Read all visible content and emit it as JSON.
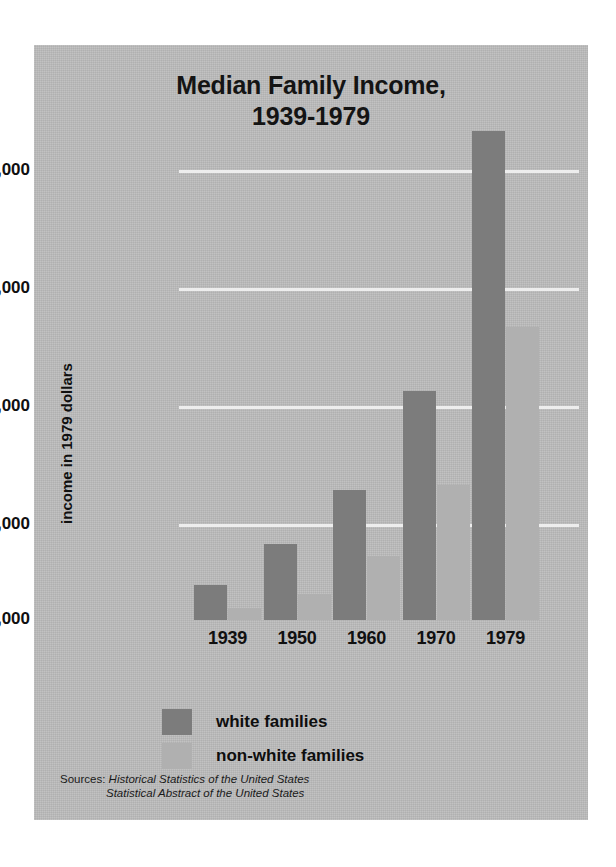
{
  "chart_data": {
    "type": "bar",
    "title": "Median Family Income, 1939-1979",
    "title_lines": [
      "Median Family Income,",
      "1939-1979"
    ],
    "xlabel": "",
    "ylabel": "income in 1979 dollars",
    "categories": [
      "1939",
      "1950",
      "1960",
      "1970",
      "1979"
    ],
    "series": [
      {
        "name": "white families",
        "color": "#7c7c7c",
        "values": [
          2500,
          4200,
          6500,
          10700,
          21700
        ]
      },
      {
        "name": "non-white families",
        "color": "#b0b0b0",
        "values": [
          1500,
          2100,
          3700,
          6700,
          13400
        ]
      }
    ],
    "ylim": [
      1000,
      23000
    ],
    "yticks": [
      1000,
      5000,
      10000,
      15000,
      20000
    ],
    "ytick_labels": [
      "$1,000",
      "$5,000",
      "$10,000",
      "$15,000",
      "$20,000"
    ],
    "gridlines": true,
    "gridline_color": "#ededed",
    "legend_position": "bottom-center",
    "background_color": "#bcbcbc",
    "page_background": "#ffffff",
    "text_color": "#101010"
  },
  "legend": {
    "items": [
      {
        "label": "white families",
        "swatch": "white-fam"
      },
      {
        "label": "non-white families",
        "swatch": "nonwhite-fam"
      }
    ]
  },
  "sources": {
    "label": "Sources:",
    "line1": "Historical Statistics of the United States",
    "line2": "Statistical Abstract of the United States"
  }
}
